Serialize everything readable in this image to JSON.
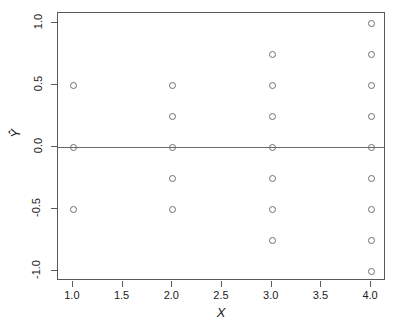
{
  "chart_data": {
    "type": "scatter",
    "title": "",
    "xlabel": "X",
    "ylabel": "Ŷ",
    "xlim": [
      0.85,
      4.15
    ],
    "ylim": [
      -1.08,
      1.08
    ],
    "grid": false,
    "legend": null,
    "xticks": [
      1.0,
      1.5,
      2.0,
      2.5,
      3.0,
      3.5,
      4.0
    ],
    "xticklabels": [
      "1.0",
      "1.5",
      "2.0",
      "2.5",
      "3.0",
      "3.5",
      "4.0"
    ],
    "yticks": [
      1.0,
      0.5,
      0.0,
      -0.5,
      -1.0
    ],
    "yticklabels": [
      "1.0",
      "0.5",
      "0.0",
      "-0.5",
      "-1.0"
    ],
    "reference_lines": [
      {
        "orientation": "horizontal",
        "y": 0.0,
        "color": "#6a6a6a"
      }
    ],
    "marker": {
      "shape": "open-circle",
      "size_px": 5,
      "edge_color": "#6e6e6e",
      "fill": "none"
    },
    "points": [
      {
        "x": 1,
        "y": 0.5
      },
      {
        "x": 1,
        "y": 0.0
      },
      {
        "x": 1,
        "y": -0.5
      },
      {
        "x": 2,
        "y": 0.5
      },
      {
        "x": 2,
        "y": 0.25
      },
      {
        "x": 2,
        "y": 0.0
      },
      {
        "x": 2,
        "y": -0.25
      },
      {
        "x": 2,
        "y": -0.5
      },
      {
        "x": 3,
        "y": 0.75
      },
      {
        "x": 3,
        "y": 0.5
      },
      {
        "x": 3,
        "y": 0.25
      },
      {
        "x": 3,
        "y": 0.0
      },
      {
        "x": 3,
        "y": -0.25
      },
      {
        "x": 3,
        "y": -0.5
      },
      {
        "x": 3,
        "y": -0.75
      },
      {
        "x": 4,
        "y": 1.0
      },
      {
        "x": 4,
        "y": 0.75
      },
      {
        "x": 4,
        "y": 0.5
      },
      {
        "x": 4,
        "y": 0.25
      },
      {
        "x": 4,
        "y": 0.0
      },
      {
        "x": 4,
        "y": -0.25
      },
      {
        "x": 4,
        "y": -0.5
      },
      {
        "x": 4,
        "y": -0.75
      },
      {
        "x": 4,
        "y": -1.0
      }
    ],
    "series": [
      {
        "name": "residuals",
        "x": [
          1,
          1,
          1,
          2,
          2,
          2,
          2,
          2,
          3,
          3,
          3,
          3,
          3,
          3,
          3,
          4,
          4,
          4,
          4,
          4,
          4,
          4,
          4,
          4
        ],
        "y": [
          0.5,
          0.0,
          -0.5,
          0.5,
          0.25,
          0.0,
          -0.25,
          -0.5,
          0.75,
          0.5,
          0.25,
          0.0,
          -0.25,
          -0.5,
          -0.75,
          1.0,
          0.75,
          0.5,
          0.25,
          0.0,
          -0.25,
          -0.5,
          -0.75,
          -1.0
        ]
      }
    ]
  },
  "figure": {
    "background": "#ffffff",
    "frame_color": "#5a5a5a",
    "text_color": "#1a1a1a"
  }
}
